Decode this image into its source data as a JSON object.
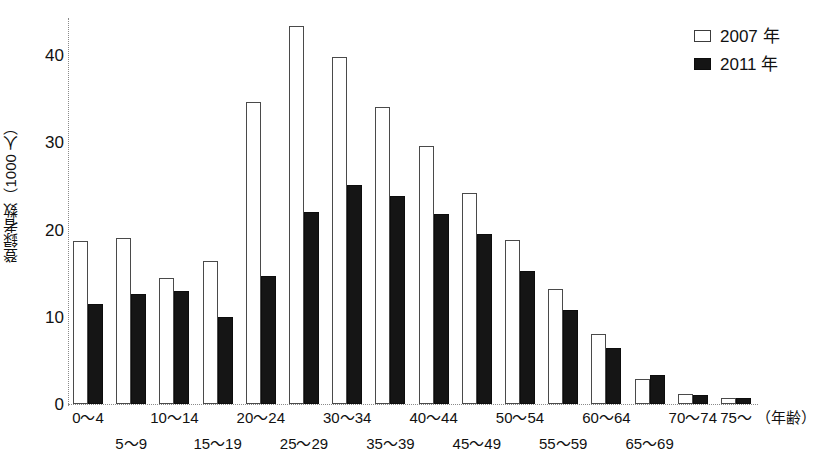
{
  "chart_data": {
    "type": "bar",
    "title": "",
    "xlabel": "（年齢）",
    "ylabel": "登録者数（1000 人）",
    "ylim": [
      0,
      45
    ],
    "yticks": [
      0,
      10,
      20,
      30,
      40
    ],
    "ytick_labels": [
      "0",
      "10",
      "20",
      "30",
      "40"
    ],
    "grid": false,
    "legend_position": "top-right",
    "categories": [
      "0〜4",
      "5〜9",
      "10〜14",
      "15〜19",
      "20〜24",
      "25〜29",
      "30〜34",
      "35〜39",
      "40〜44",
      "45〜49",
      "50〜54",
      "55〜59",
      "60〜64",
      "65〜69",
      "70〜74",
      "75〜"
    ],
    "series": [
      {
        "name": "2007 年",
        "style": "open",
        "values": [
          18.6,
          19.0,
          14.4,
          16.3,
          34.5,
          43.2,
          39.7,
          33.9,
          29.5,
          24.1,
          18.7,
          13.1,
          8.0,
          2.9,
          1.1,
          0.7
        ]
      },
      {
        "name": "2011 年",
        "style": "filled",
        "values": [
          11.4,
          12.6,
          12.9,
          10.0,
          14.6,
          22.0,
          25.0,
          23.8,
          21.7,
          19.4,
          15.2,
          10.8,
          6.4,
          3.3,
          1.0,
          0.7
        ]
      }
    ]
  },
  "axis": {
    "y_title": "登録者数（1000 人）",
    "x_unit": "（年齢）",
    "y_tick_labels": [
      "40",
      "30",
      "20",
      "10",
      "0"
    ]
  },
  "legend": {
    "items": [
      {
        "label": "2007 年",
        "marker": "open-square-icon",
        "color": "#ffffff"
      },
      {
        "label": "2011 年",
        "marker": "filled-square-icon",
        "color": "#151515"
      }
    ]
  },
  "x_labels": {
    "row1": [
      "0〜4",
      "10〜14",
      "20〜24",
      "30〜34",
      "40〜44",
      "50〜54",
      "60〜64",
      "70〜74",
      "75〜"
    ],
    "row2": [
      "5〜9",
      "15〜19",
      "25〜29",
      "35〜39",
      "45〜49",
      "55〜59",
      "65〜69"
    ]
  },
  "colors": {
    "series_2007": "#ffffff",
    "series_2007_outline": "#4a4a4a",
    "series_2011": "#151515",
    "axis": "#8a8a8a",
    "text": "#111111",
    "background": "#ffffff"
  }
}
